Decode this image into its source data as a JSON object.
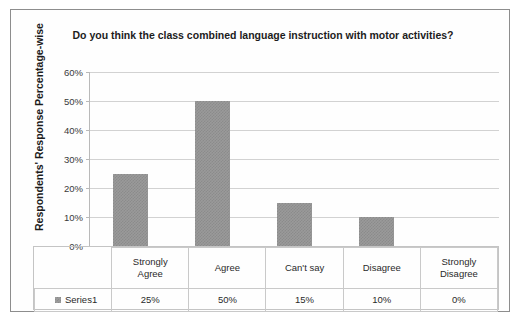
{
  "chart_data": {
    "type": "bar",
    "title": "Do you think the class combined language instruction with motor activities?",
    "xlabel": "",
    "ylabel": "Respondents' Response Percentage-wise",
    "categories": [
      "Strongly Agree",
      "Agree",
      "Can't say",
      "Disagree",
      "Strongly Disagree"
    ],
    "category_lines": [
      [
        "Strongly",
        "Agree"
      ],
      [
        "Agree"
      ],
      [
        "Can't say"
      ],
      [
        "Disagree"
      ],
      [
        "Strongly",
        "Disagree"
      ]
    ],
    "values": [
      25,
      50,
      15,
      10,
      0
    ],
    "value_labels": [
      "25%",
      "50%",
      "15%",
      "10%",
      "0%"
    ],
    "series": [
      {
        "name": "Series1",
        "values": [
          25,
          50,
          15,
          10,
          0
        ]
      }
    ],
    "ylim": [
      0,
      60
    ],
    "ytick_values": [
      60,
      50,
      40,
      30,
      20,
      10,
      0
    ],
    "ytick_labels": [
      "60%",
      "50%",
      "40%",
      "30%",
      "20%",
      "10%",
      "0%"
    ],
    "grid": true,
    "legend": {
      "position": "data-table-row",
      "entries": [
        "Series1"
      ]
    },
    "colors": {
      "bar_fill": "#9a9a9a",
      "bar_pattern": "#8b8b8b",
      "gridline": "#d2d2d2",
      "axis": "#b9b9b9",
      "text": "#262626",
      "frame_border": "#8d8d8d",
      "table_border": "#c9c9c9",
      "background": "#fefefe"
    }
  },
  "legend_row": {
    "swatch_icon": "series-color-swatch",
    "label": "Series1"
  }
}
